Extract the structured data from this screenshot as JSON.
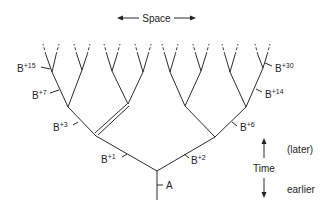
{
  "space_axis": {
    "label": "Space"
  },
  "time_axis": {
    "label": "Time",
    "later": "(later)",
    "earlier": "earlier"
  },
  "nodes": {
    "root": {
      "base": "A",
      "sup": ""
    },
    "b1": {
      "base": "B",
      "sup": "+1"
    },
    "b2": {
      "base": "B",
      "sup": "+2"
    },
    "b3": {
      "base": "B",
      "sup": "+3"
    },
    "b6": {
      "base": "B",
      "sup": "+6"
    },
    "b7": {
      "base": "B",
      "sup": "+7"
    },
    "b14": {
      "base": "B",
      "sup": "+14"
    },
    "b15": {
      "base": "B",
      "sup": "+15"
    },
    "b30": {
      "base": "B",
      "sup": "+30"
    }
  },
  "colors": {
    "line": "#2b2b2b",
    "text": "#222222",
    "background": "#ffffff"
  }
}
